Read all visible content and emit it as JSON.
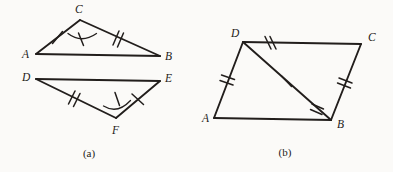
{
  "page": {
    "background_color": "#fbfaf8",
    "ink_color": "#221e1c",
    "width": 393,
    "height": 172
  },
  "figures": [
    {
      "id": "figure-a",
      "caption": "(a)",
      "caption_pos": {
        "x": 89,
        "y": 157
      },
      "description": "Two triangles ABC and DEF shown one above the other with congruence tick marks and angle arcs",
      "shapes": [
        {
          "name": "triangle-abc",
          "vertices": [
            {
              "label": "A",
              "x": 36,
              "y": 54,
              "label_x": 22,
              "label_y": 58
            },
            {
              "label": "B",
              "x": 160,
              "y": 56,
              "label_x": 165,
              "label_y": 60
            },
            {
              "label": "C",
              "x": 80,
              "y": 20,
              "label_x": 75,
              "label_y": 13
            }
          ],
          "sides": [
            {
              "name": "side-AC",
              "from": "A",
              "to": "C",
              "ticks": 1
            },
            {
              "name": "side-CB",
              "from": "C",
              "to": "B",
              "ticks": 2
            },
            {
              "name": "side-AB",
              "from": "A",
              "to": "B",
              "ticks": 0
            }
          ],
          "angles": [
            {
              "name": "angle-C",
              "at": "C",
              "arc": true,
              "ticks": 1
            }
          ]
        },
        {
          "name": "triangle-def",
          "vertices": [
            {
              "label": "D",
              "x": 36,
              "y": 79,
              "label_x": 22,
              "label_y": 81
            },
            {
              "label": "E",
              "x": 160,
              "y": 81,
              "label_x": 165,
              "label_y": 82
            },
            {
              "label": "F",
              "x": 116,
              "y": 118,
              "label_x": 112,
              "label_y": 134
            }
          ],
          "sides": [
            {
              "name": "side-DF",
              "from": "D",
              "to": "F",
              "ticks": 2
            },
            {
              "name": "side-FE",
              "from": "F",
              "to": "E",
              "ticks": 1
            },
            {
              "name": "side-DE",
              "from": "D",
              "to": "E",
              "ticks": 0
            }
          ],
          "angles": [
            {
              "name": "angle-F",
              "at": "F",
              "arc": true,
              "ticks": 1
            }
          ]
        }
      ]
    },
    {
      "id": "figure-b",
      "caption": "(b)",
      "caption_pos": {
        "x": 285,
        "y": 156
      },
      "description": "Parallelogram ABCD with diagonal DB drawn, tick marks marking congruent sides and the shared diagonal",
      "shapes": [
        {
          "name": "parallelogram-abcd",
          "vertices": [
            {
              "label": "A",
              "x": 214,
              "y": 118,
              "label_x": 202,
              "label_y": 122
            },
            {
              "label": "B",
              "x": 331,
              "y": 120,
              "label_x": 337,
              "label_y": 128
            },
            {
              "label": "C",
              "x": 361,
              "y": 44,
              "label_x": 368,
              "label_y": 41
            },
            {
              "label": "D",
              "x": 243,
              "y": 42,
              "label_x": 231,
              "label_y": 37
            }
          ],
          "sides": [
            {
              "name": "side-DC",
              "from": "D",
              "to": "C",
              "ticks": 2
            },
            {
              "name": "side-CB",
              "from": "C",
              "to": "B",
              "ticks": 2
            },
            {
              "name": "side-AD",
              "from": "A",
              "to": "D",
              "ticks": 2
            },
            {
              "name": "side-AB",
              "from": "A",
              "to": "B",
              "ticks": 0
            },
            {
              "name": "diagonal-DB",
              "from": "D",
              "to": "B",
              "ticks": 1
            }
          ],
          "extra_ticks": [
            {
              "name": "tick-near-B-on-AB",
              "ticks": 2
            }
          ],
          "angles": []
        }
      ]
    }
  ]
}
